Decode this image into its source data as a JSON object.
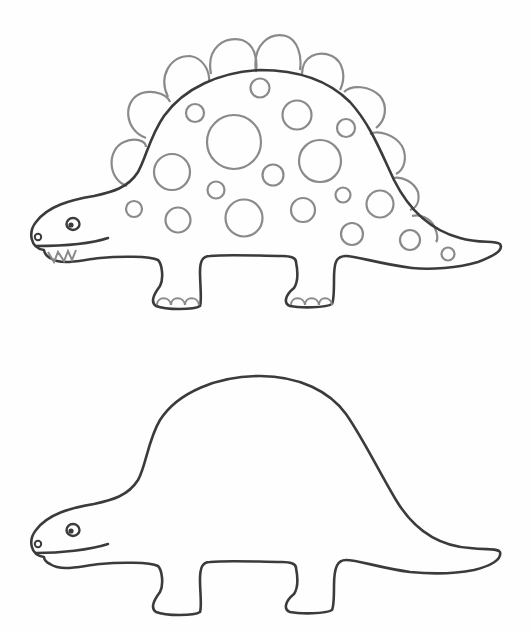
{
  "illustration": {
    "title": "Dinosaur coloring page",
    "colors": {
      "background": "#fefefe",
      "outline": "#3b3b3b",
      "detail": "#8a8a8a"
    },
    "figures": [
      {
        "name": "stegosaurus-with-plates-and-spots",
        "plates": 11,
        "spots": 24,
        "toes_per_foot": 4
      },
      {
        "name": "plain-dinosaur-outline",
        "plates": 0,
        "spots": 0
      }
    ]
  }
}
